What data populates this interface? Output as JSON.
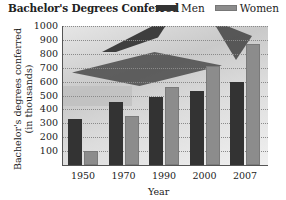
{
  "chart_data": {
    "type": "bar",
    "title": "Bachelor's Degrees Conferred",
    "xlabel": "Year",
    "ylabel": "Bachelor's degrees conferred (in thousands)",
    "ylabel_lines": [
      "Bachelor's degrees conferred",
      "(in thousands)"
    ],
    "categories": [
      "1950",
      "1970",
      "1990",
      "2000",
      "2007"
    ],
    "series": [
      {
        "name": "Men",
        "color": "#333333",
        "values": [
          330,
          450,
          490,
          530,
          600
        ]
      },
      {
        "name": "Women",
        "color": "#8c8c8c",
        "values": [
          100,
          350,
          560,
          710,
          870
        ]
      }
    ],
    "yticks": [
      "1000",
      "900",
      "800",
      "700",
      "600",
      "500",
      "400",
      "300",
      "200",
      "100"
    ],
    "ylim": [
      0,
      1000
    ],
    "grid": true,
    "legend_position": "top-right"
  }
}
